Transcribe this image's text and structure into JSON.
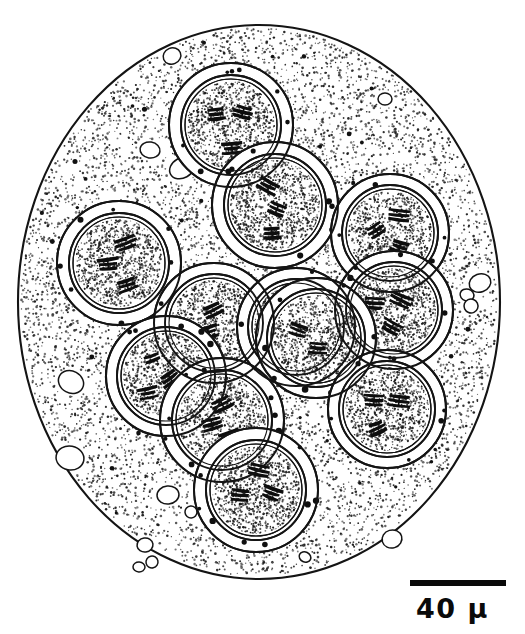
{
  "figure": {
    "style": "ink-stipple-line-drawing",
    "background_color": "#ffffff",
    "ink_color": "#141414"
  },
  "scale_bar": {
    "label": "40 μ",
    "value": 40,
    "unit": "μ",
    "bar_x": 410,
    "bar_y": 580,
    "bar_width": 96,
    "bar_height": 6,
    "label_x": 416,
    "label_y": 595,
    "color": "#0a0a0a"
  },
  "cell": {
    "name": "cell-body",
    "shape": "ellipse",
    "cx": 259,
    "cy": 302,
    "rx": 241,
    "ry": 277,
    "outline_color": "#141414",
    "outline_width": 2.1,
    "fill_color": "#ffffff",
    "stipple_color": "#1e1e1e",
    "stipple_count": 4200
  },
  "nuclei": [
    {
      "id": "nucleus-top-left-upper",
      "label": "N1",
      "cx": 231,
      "cy": 125,
      "halo_r": 62,
      "membrane_outer_r": 50,
      "membrane_inner_r": 46,
      "plasm_r": 44,
      "granules": 7,
      "chromosomes": [
        {
          "x": 216,
          "y": 114,
          "angle": -8,
          "len": 19,
          "strokes": 3
        },
        {
          "x": 243,
          "y": 112,
          "angle": 16,
          "len": 18,
          "strokes": 3
        },
        {
          "x": 232,
          "y": 148,
          "angle": -4,
          "len": 20,
          "strokes": 3
        }
      ]
    },
    {
      "id": "nucleus-top-center",
      "label": "N2",
      "cx": 275,
      "cy": 205,
      "halo_r": 63,
      "membrane_outer_r": 51,
      "membrane_inner_r": 47,
      "plasm_r": 45,
      "granules": 7,
      "chromosomes": [
        {
          "x": 268,
          "y": 186,
          "angle": 28,
          "len": 21,
          "strokes": 3
        },
        {
          "x": 277,
          "y": 209,
          "angle": 22,
          "len": 19,
          "strokes": 3
        },
        {
          "x": 272,
          "y": 233,
          "angle": -6,
          "len": 18,
          "strokes": 3
        }
      ]
    },
    {
      "id": "nucleus-left-upper",
      "label": "N3",
      "cx": 119,
      "cy": 263,
      "halo_r": 62,
      "membrane_outer_r": 50,
      "membrane_inner_r": 46,
      "plasm_r": 44,
      "granules": 8,
      "chromosomes": [
        {
          "x": 126,
          "y": 243,
          "angle": -22,
          "len": 22,
          "strokes": 3
        },
        {
          "x": 108,
          "y": 264,
          "angle": -5,
          "len": 21,
          "strokes": 3
        },
        {
          "x": 127,
          "y": 285,
          "angle": -18,
          "len": 21,
          "strokes": 3
        }
      ]
    },
    {
      "id": "nucleus-right-upper",
      "label": "N4",
      "cx": 390,
      "cy": 233,
      "halo_r": 59,
      "membrane_outer_r": 48,
      "membrane_inner_r": 44,
      "plasm_r": 42,
      "granules": 7,
      "chromosomes": [
        {
          "x": 399,
          "y": 215,
          "angle": 4,
          "len": 19,
          "strokes": 3
        },
        {
          "x": 376,
          "y": 230,
          "angle": -30,
          "len": 19,
          "strokes": 3
        },
        {
          "x": 400,
          "y": 247,
          "angle": 18,
          "len": 18,
          "strokes": 3
        }
      ]
    },
    {
      "id": "nucleus-right-middle",
      "label": "N5",
      "cx": 394,
      "cy": 310,
      "halo_r": 59,
      "membrane_outer_r": 48,
      "membrane_inner_r": 44,
      "plasm_r": 42,
      "granules": 7,
      "chromosomes": [
        {
          "x": 375,
          "y": 303,
          "angle": 6,
          "len": 19,
          "strokes": 3
        },
        {
          "x": 401,
          "y": 300,
          "angle": 24,
          "len": 21,
          "strokes": 3
        },
        {
          "x": 392,
          "y": 327,
          "angle": 30,
          "len": 19,
          "strokes": 3
        }
      ]
    },
    {
      "id": "nucleus-center-left",
      "label": "N6",
      "cx": 214,
      "cy": 323,
      "halo_r": 60,
      "membrane_outer_r": 49,
      "membrane_inner_r": 45,
      "plasm_r": 43,
      "granules": 7,
      "chromosomes": [
        {
          "x": 213,
          "y": 310,
          "angle": -26,
          "len": 21,
          "strokes": 3
        },
        {
          "x": 208,
          "y": 332,
          "angle": -14,
          "len": 20,
          "strokes": 3
        },
        {
          "x": 212,
          "y": 352,
          "angle": -8,
          "len": 18,
          "strokes": 3
        }
      ]
    },
    {
      "id": "nucleus-center-right",
      "label": "N7",
      "cx": 296,
      "cy": 327,
      "halo_r": 59,
      "membrane_outer_r": 48,
      "membrane_inner_r": 44,
      "plasm_r": 42,
      "granules": 6,
      "chromosomes": [
        {
          "x": 273,
          "y": 311,
          "angle": 34,
          "len": 20,
          "strokes": 2
        },
        {
          "x": 297,
          "y": 330,
          "angle": 22,
          "len": 21,
          "strokes": 3
        },
        {
          "x": 310,
          "y": 347,
          "angle": 8,
          "len": 19,
          "strokes": 3
        }
      ]
    },
    {
      "id": "nucleus-center-far-right",
      "label": "N8",
      "cx": 295,
      "cy": 337,
      "halo_r": 0,
      "membrane_outer_r": 0,
      "membrane_inner_r": 0,
      "plasm_r": 0,
      "granules": 0,
      "chromosomes": []
    },
    {
      "id": "nucleus-mid-right-block",
      "label": "N9",
      "cx": 316,
      "cy": 338,
      "halo_r": 60,
      "membrane_outer_r": 49,
      "membrane_inner_r": 45,
      "plasm_r": 43,
      "granules": 7,
      "chromosomes": [
        {
          "x": 298,
          "y": 330,
          "angle": 18,
          "len": 20,
          "strokes": 3
        },
        {
          "x": 318,
          "y": 348,
          "angle": 6,
          "len": 19,
          "strokes": 3
        }
      ]
    },
    {
      "id": "nucleus-lower-left",
      "label": "N10",
      "cx": 166,
      "cy": 376,
      "halo_r": 60,
      "membrane_outer_r": 49,
      "membrane_inner_r": 45,
      "plasm_r": 43,
      "granules": 7,
      "chromosomes": [
        {
          "x": 152,
          "y": 358,
          "angle": -22,
          "len": 20,
          "strokes": 2
        },
        {
          "x": 170,
          "y": 378,
          "angle": -34,
          "len": 21,
          "strokes": 3
        },
        {
          "x": 148,
          "y": 393,
          "angle": -14,
          "len": 19,
          "strokes": 3
        }
      ]
    },
    {
      "id": "nucleus-lower-center",
      "label": "N11",
      "cx": 222,
      "cy": 420,
      "halo_r": 62,
      "membrane_outer_r": 50,
      "membrane_inner_r": 46,
      "plasm_r": 44,
      "granules": 8,
      "chromosomes": [
        {
          "x": 222,
          "y": 404,
          "angle": -28,
          "len": 22,
          "strokes": 3
        },
        {
          "x": 212,
          "y": 424,
          "angle": -16,
          "len": 24,
          "strokes": 3
        },
        {
          "x": 230,
          "y": 437,
          "angle": -20,
          "len": 20,
          "strokes": 3
        }
      ]
    },
    {
      "id": "nucleus-right-lower",
      "label": "N12",
      "cx": 387,
      "cy": 409,
      "halo_r": 59,
      "membrane_outer_r": 48,
      "membrane_inner_r": 44,
      "plasm_r": 42,
      "granules": 7,
      "chromosomes": [
        {
          "x": 374,
          "y": 400,
          "angle": 2,
          "len": 19,
          "strokes": 3
        },
        {
          "x": 399,
          "y": 401,
          "angle": 6,
          "len": 21,
          "strokes": 3
        },
        {
          "x": 377,
          "y": 428,
          "angle": -22,
          "len": 18,
          "strokes": 3
        }
      ]
    },
    {
      "id": "nucleus-bottom",
      "label": "N13",
      "cx": 256,
      "cy": 490,
      "halo_r": 62,
      "membrane_outer_r": 50,
      "membrane_inner_r": 46,
      "plasm_r": 44,
      "granules": 8,
      "chromosomes": [
        {
          "x": 259,
          "y": 470,
          "angle": 12,
          "len": 20,
          "strokes": 3
        },
        {
          "x": 240,
          "y": 495,
          "angle": 6,
          "len": 21,
          "strokes": 3
        },
        {
          "x": 272,
          "y": 493,
          "angle": 22,
          "len": 20,
          "strokes": 3
        }
      ]
    }
  ],
  "vacuoles": [
    {
      "cx": 172,
      "cy": 56,
      "rx": 9,
      "ry": 8
    },
    {
      "cx": 150,
      "cy": 150,
      "rx": 10,
      "ry": 8
    },
    {
      "cx": 182,
      "cy": 168,
      "rx": 13,
      "ry": 10
    },
    {
      "cx": 385,
      "cy": 99,
      "rx": 7,
      "ry": 6
    },
    {
      "cx": 320,
      "cy": 219,
      "rx": 8,
      "ry": 7
    },
    {
      "cx": 480,
      "cy": 283,
      "rx": 11,
      "ry": 9
    },
    {
      "cx": 467,
      "cy": 295,
      "rx": 7,
      "ry": 6
    },
    {
      "cx": 471,
      "cy": 306,
      "rx": 7,
      "ry": 7
    },
    {
      "cx": 71,
      "cy": 382,
      "rx": 13,
      "ry": 11
    },
    {
      "cx": 70,
      "cy": 458,
      "rx": 14,
      "ry": 12
    },
    {
      "cx": 168,
      "cy": 495,
      "rx": 11,
      "ry": 9
    },
    {
      "cx": 191,
      "cy": 512,
      "rx": 6,
      "ry": 6
    },
    {
      "cx": 145,
      "cy": 545,
      "rx": 8,
      "ry": 7
    },
    {
      "cx": 152,
      "cy": 562,
      "rx": 6,
      "ry": 6
    },
    {
      "cx": 139,
      "cy": 567,
      "rx": 6,
      "ry": 5
    },
    {
      "cx": 392,
      "cy": 539,
      "rx": 10,
      "ry": 9
    },
    {
      "cx": 305,
      "cy": 557,
      "rx": 6,
      "ry": 5
    }
  ]
}
